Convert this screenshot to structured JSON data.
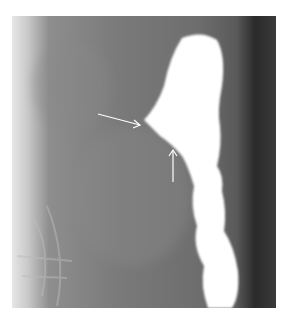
{
  "image": {
    "kind": "radiograph",
    "description": "Barium contrast study of colon segment with two arrows indicating narrowing",
    "annotations": [
      {
        "type": "arrow",
        "direction": "right-down",
        "label": ""
      },
      {
        "type": "arrow",
        "direction": "up",
        "label": ""
      }
    ],
    "colors": {
      "contrast": "#ffffff",
      "background": "#7a7a7a",
      "edge_dark": "#2a2a2a"
    }
  }
}
